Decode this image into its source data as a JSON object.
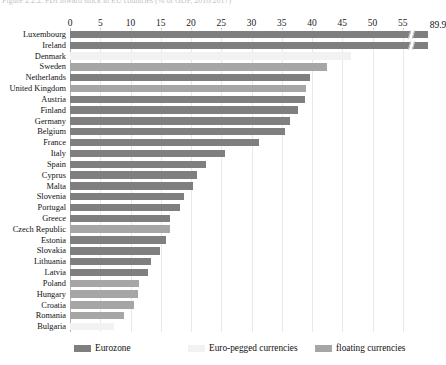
{
  "caption": {
    "prefix": "Figure 2.2.2.",
    "text": "Figure 2.2.2.  FDI inward stock in EU countries (% of GDP, 2016/2017)"
  },
  "legend": {
    "position": "bottom",
    "items": [
      {
        "label": "Eurozone",
        "color": "#7f7f7f",
        "key": "eurozone"
      },
      {
        "label": "Euro-pegged currencies",
        "color": "#f2f2f2",
        "key": "euro-pegged"
      },
      {
        "label": "floating currencies",
        "color": "#a6a6a6",
        "key": "floating"
      }
    ]
  },
  "chart_data": {
    "type": "bar",
    "orientation": "horizontal",
    "title": "Figure 2.2.2.  FDI inward stock in EU countries (% of GDP, 2016/2017)",
    "xlabel": "",
    "ylabel": "",
    "xlim": [
      0,
      57.5
    ],
    "xticks": [
      0,
      5,
      10,
      15,
      20,
      25,
      30,
      35,
      40,
      45,
      50,
      55
    ],
    "grid": true,
    "axis_break": {
      "present": true,
      "at": 56.2,
      "note": "Luxembourg bar is broken; true value printed at bar end"
    },
    "categories": [
      "Luxembourg",
      "Ireland",
      "Denmark",
      "Sweden",
      "Netherlands",
      "United Kingdom",
      "Austria",
      "Finland",
      "Germany",
      "Belgium",
      "France",
      "Italy",
      "Spain",
      "Cyprus",
      "Malta",
      "Slovenia",
      "Portugal",
      "Greece",
      "Czech Republic",
      "Estonia",
      "Slovakia",
      "Lithuania",
      "Latvia",
      "Poland",
      "Hungary",
      "Croatia",
      "Romania",
      "Bulgaria"
    ],
    "values": [
      89.9,
      56.5,
      46.5,
      42.5,
      39.6,
      39.0,
      38.9,
      37.6,
      36.4,
      35.6,
      31.3,
      25.6,
      22.5,
      21.0,
      20.3,
      18.9,
      18.2,
      16.6,
      16.5,
      15.9,
      14.9,
      13.4,
      12.9,
      11.4,
      11.2,
      10.6,
      8.9,
      7.3
    ],
    "groups": [
      "eurozone",
      "eurozone",
      "euro-pegged",
      "floating",
      "eurozone",
      "floating",
      "eurozone",
      "eurozone",
      "eurozone",
      "eurozone",
      "eurozone",
      "eurozone",
      "eurozone",
      "eurozone",
      "eurozone",
      "eurozone",
      "eurozone",
      "eurozone",
      "floating",
      "eurozone",
      "eurozone",
      "eurozone",
      "eurozone",
      "floating",
      "floating",
      "floating",
      "floating",
      "euro-pegged"
    ],
    "value_labels": {
      "Luxembourg": "89.9"
    },
    "colors": {
      "eurozone": "#7f7f7f",
      "euro-pegged": "#f2f2f2",
      "floating": "#a6a6a6"
    }
  }
}
